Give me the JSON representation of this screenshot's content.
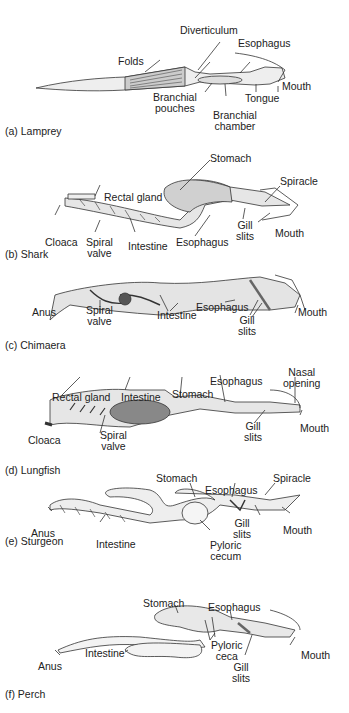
{
  "figure": {
    "panels": [
      {
        "id": "a",
        "caption": "(a) Lamprey",
        "labels": {
          "diverticulum": "Diverticulum",
          "esophagus": "Esophagus",
          "folds": "Folds",
          "mouth": "Mouth",
          "tongue": "Tongue",
          "branchial_pouches_1": "Branchial",
          "branchial_pouches_2": "pouches",
          "branchial_chamber_1": "Branchial",
          "branchial_chamber_2": "chamber"
        }
      },
      {
        "id": "b",
        "caption": "(b) Shark",
        "labels": {
          "stomach": "Stomach",
          "spiracle": "Spiracle",
          "rectal_gland": "Rectal gland",
          "gill_slits_1": "Gill",
          "gill_slits_2": "slits",
          "mouth": "Mouth",
          "cloaca": "Cloaca",
          "spiral_valve_1": "Spiral",
          "spiral_valve_2": "valve",
          "intestine": "Intestine",
          "esophagus": "Esophagus"
        }
      },
      {
        "id": "c",
        "caption": "(c) Chimaera",
        "labels": {
          "anus": "Anus",
          "spiral_valve_1": "Spiral",
          "spiral_valve_2": "valve",
          "intestine": "Intestine",
          "esophagus": "Esophagus",
          "gill_slits_1": "Gill",
          "gill_slits_2": "slits",
          "mouth": "Mouth"
        }
      },
      {
        "id": "d",
        "caption": "(d) Lungfish",
        "labels": {
          "nasal_opening_1": "Nasal",
          "nasal_opening_2": "opening",
          "esophagus": "Esophagus",
          "rectal_gland": "Rectal gland",
          "intestine": "Intestine",
          "stomach": "Stomach",
          "gill_slits_1": "Gill",
          "gill_slits_2": "slits",
          "mouth": "Mouth",
          "cloaca": "Cloaca",
          "spiral_valve_1": "Spiral",
          "spiral_valve_2": "valve"
        }
      },
      {
        "id": "e",
        "caption": "(e) Sturgeon",
        "labels": {
          "stomach": "Stomach",
          "esophagus": "Esophagus",
          "spiracle": "Spiracle",
          "gill_slits_1": "Gill",
          "gill_slits_2": "slits",
          "mouth": "Mouth",
          "anus": "Anus",
          "intestine": "Intestine",
          "pyloric_cecum_1": "Pyloric",
          "pyloric_cecum_2": "cecum"
        }
      },
      {
        "id": "f",
        "caption": "(f) Perch",
        "labels": {
          "stomach": "Stomach",
          "esophagus": "Esophagus",
          "intestine": "Intestine",
          "pyloric_ceca_1": "Pyloric",
          "pyloric_ceca_2": "ceca",
          "anus": "Anus",
          "gill_slits_1": "Gill",
          "gill_slits_2": "slits",
          "mouth": "Mouth"
        }
      }
    ]
  }
}
